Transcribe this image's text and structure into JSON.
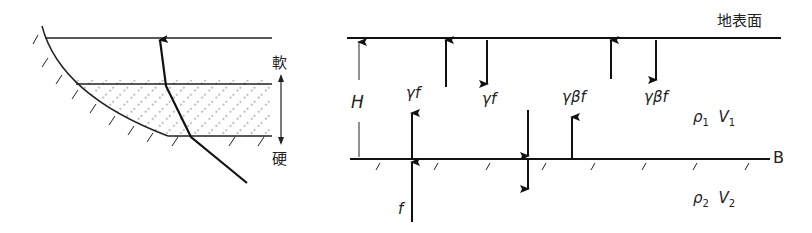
{
  "left_diagram": {
    "soft_label": "軟",
    "hard_label": "硬"
  },
  "right_diagram": {
    "surface_label": "地表面",
    "boundary_label": "B",
    "thickness_label": "H",
    "incident_label": "f",
    "wave_labels": [
      "γf",
      "γf",
      "γβf",
      "γβf"
    ],
    "layer1": {
      "rho": "ρ",
      "rho_sub": "1",
      "v": "V",
      "v_sub": "1"
    },
    "layer2": {
      "rho": "ρ",
      "rho_sub": "2",
      "v": "V",
      "v_sub": "2"
    }
  }
}
